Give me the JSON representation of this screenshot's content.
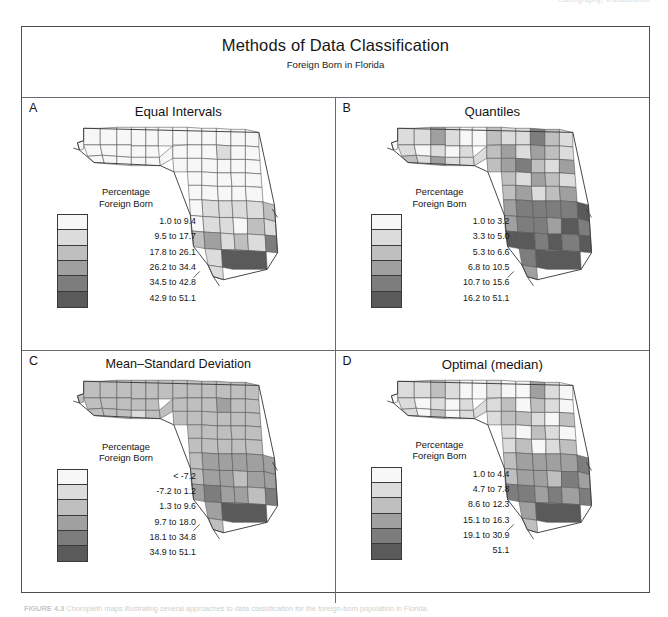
{
  "running_head": "Cartography, Visualization",
  "figure": {
    "title": "Methods of Data Classification",
    "subtitle": "Foreign Born in Florida",
    "legend_title_line1": "Percentage",
    "legend_title_line2": "Foreign Born",
    "caption_lead": "FIGURE 4.3",
    "caption_text": "Choropleth maps illustrating several approaches to data classification for the foreign-born population in Florida."
  },
  "swatch_colors": [
    "#f7f7f7",
    "#dcdcdc",
    "#bfbfbf",
    "#a0a0a0",
    "#7d7d7d",
    "#5a5a5a"
  ],
  "panels": [
    {
      "letter": "A",
      "title": "Equal Intervals",
      "wide": false,
      "classes": [
        "1.0 to 9.4",
        "9.5 to 17.7",
        "17.8 to 26.1",
        "26.2 to 34.4",
        "34.5 to 42.8",
        "42.9 to 51.1"
      ],
      "county_classes": [
        0,
        0,
        0,
        0,
        0,
        0,
        0,
        0,
        0,
        0,
        0,
        0,
        0,
        0,
        0,
        0,
        0,
        0,
        0,
        0,
        0,
        0,
        0,
        0,
        0,
        0,
        0,
        1,
        0,
        0,
        0,
        0,
        0,
        0,
        0,
        0,
        0,
        0,
        0,
        0,
        0,
        0,
        0,
        0,
        0,
        0,
        1,
        1,
        1,
        0,
        1,
        2,
        0,
        1,
        1,
        0,
        2,
        1,
        2,
        3,
        1,
        2,
        1,
        4,
        1,
        5,
        1
      ]
    },
    {
      "letter": "B",
      "title": "Quantiles",
      "wide": false,
      "classes": [
        "1.0 to 3.2",
        "3.3 to 5.0",
        "5.3 to 6.6",
        "6.8 to 10.5",
        "10.7 to 15.6",
        "16.2 to 51.1"
      ],
      "county_classes": [
        1,
        1,
        3,
        1,
        0,
        1,
        0,
        1,
        0,
        1,
        0,
        2,
        1,
        3,
        1,
        1,
        0,
        2,
        1,
        1,
        1,
        2,
        3,
        1,
        4,
        2,
        1,
        3,
        2,
        1,
        2,
        3,
        4,
        2,
        1,
        3,
        2,
        1,
        3,
        2,
        1,
        2,
        3,
        1,
        2,
        3,
        4,
        4,
        4,
        3,
        4,
        5,
        3,
        4,
        4,
        3,
        5,
        4,
        5,
        5,
        4,
        5,
        4,
        5,
        4,
        5,
        3
      ]
    },
    {
      "letter": "C",
      "title": "Mean–Standard Deviation",
      "wide": true,
      "classes": [
        "< -7.2",
        "-7.2 to 1.2",
        "1.3 to 9.6",
        "9.7 to 18.0",
        "18.1 to 34.8",
        "34.9 to 51.1"
      ],
      "county_classes": [
        2,
        2,
        2,
        2,
        2,
        2,
        2,
        2,
        2,
        2,
        2,
        2,
        2,
        2,
        1,
        2,
        2,
        2,
        2,
        2,
        2,
        2,
        2,
        2,
        2,
        2,
        2,
        3,
        2,
        2,
        2,
        2,
        2,
        2,
        2,
        2,
        2,
        2,
        2,
        2,
        2,
        2,
        2,
        2,
        2,
        2,
        3,
        3,
        3,
        2,
        3,
        3,
        2,
        3,
        3,
        2,
        3,
        3,
        3,
        4,
        3,
        3,
        2,
        4,
        3,
        5,
        2
      ]
    },
    {
      "letter": "D",
      "title": "Optimal (median)",
      "wide": false,
      "classes": [
        "1.0 to 4.4",
        "4.7 to 7.8",
        "8.6 to 12.3",
        "15.1 to 16.3",
        "19.1 to 30.9",
        "51.1"
      ],
      "county_classes": [
        1,
        1,
        2,
        1,
        0,
        1,
        0,
        1,
        0,
        1,
        0,
        1,
        0,
        2,
        0,
        1,
        0,
        1,
        0,
        0,
        1,
        1,
        2,
        0,
        3,
        1,
        0,
        2,
        1,
        0,
        1,
        2,
        2,
        1,
        0,
        2,
        1,
        0,
        2,
        1,
        0,
        1,
        2,
        0,
        1,
        2,
        3,
        3,
        3,
        2,
        3,
        4,
        2,
        3,
        3,
        2,
        4,
        3,
        4,
        4,
        3,
        4,
        3,
        4,
        3,
        5,
        2
      ]
    }
  ]
}
